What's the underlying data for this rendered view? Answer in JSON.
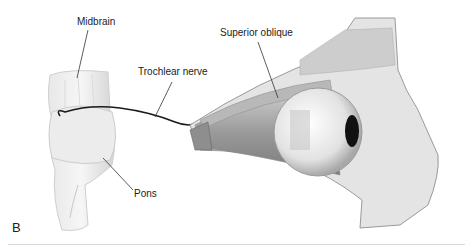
{
  "figure": {
    "panel_label": "B",
    "labels": {
      "midbrain": "Midbrain",
      "trochlear_nerve": "Trochlear nerve",
      "superior_oblique": "Superior oblique",
      "pons": "Pons"
    }
  }
}
